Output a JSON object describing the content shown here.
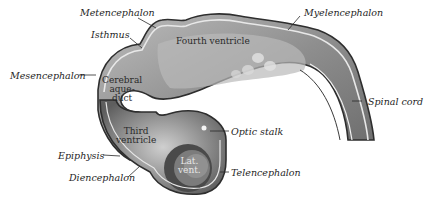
{
  "figure": {
    "outer_labels": {
      "metencephalon": "Metencephalon",
      "isthmus": "Isthmus",
      "mesencephalon": "Mesencephalon",
      "myelencephalon": "Myelencephalon",
      "spinal_cord": "Spinal cord",
      "optic_stalk": "Optic stalk",
      "epiphysis": "Epiphysis",
      "diencephalon": "Diencephalon",
      "telencephalon": "Telencephalon"
    },
    "inner_labels": {
      "fourth_ventricle": "Fourth ventricle",
      "cerebral_aqueduct": "Cerebral\naque-\nduct",
      "third_ventricle": "Third\nventricle",
      "lateral_ventricle": "Lat.\nvent."
    },
    "colors": {
      "wall_dark": "#555555",
      "wall_mid": "#9a9a9a",
      "wall_light": "#d6d6d6",
      "outline": "#333333",
      "background": "#ffffff"
    }
  }
}
